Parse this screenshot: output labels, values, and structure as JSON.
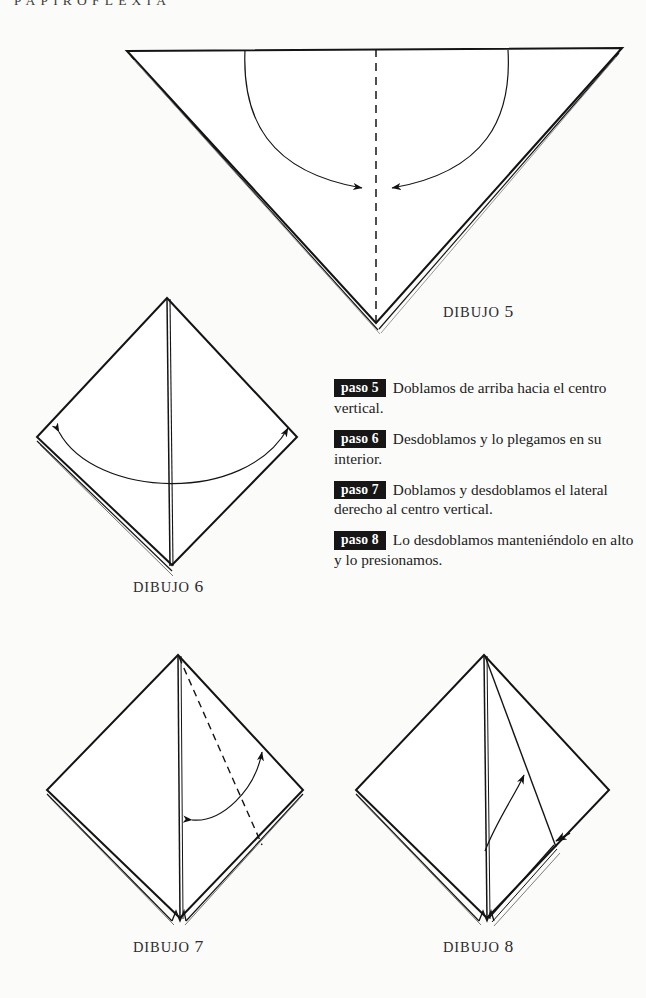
{
  "page": {
    "running_head": "PAPIROFLEXIA",
    "background_color": "#fbfbfa",
    "ink_color": "#1a1a1a"
  },
  "steps": [
    {
      "badge": "paso 5",
      "text": "Doblamos de arriba hacia el centro vertical."
    },
    {
      "badge": "paso 6",
      "text": "Desdoblamos y lo plegamos en su interior."
    },
    {
      "badge": "paso 7",
      "text": "Doblamos y desdoblamos el lateral derecho al centro vertical."
    },
    {
      "badge": "paso 8",
      "text": "Lo desdoblamos manteniéndolo en alto y lo presionamos."
    }
  ],
  "figures": [
    {
      "caption_word": "DIBUJO",
      "caption_number": "5",
      "shape": "inverted-triangle",
      "fold_line": "dashed-vertical-center",
      "arrows": "two-converging-arcs"
    },
    {
      "caption_word": "DIBUJO",
      "caption_number": "6",
      "shape": "diamond-kite",
      "fold_line": "solid-vertical-center",
      "arrows": "wide-arc-both-ends"
    },
    {
      "caption_word": "DIBUJO",
      "caption_number": "7",
      "shape": "diamond-kite",
      "fold_line": "dashed-diagonal-right",
      "arrows": "double-headed-arc"
    },
    {
      "caption_word": "DIBUJO",
      "caption_number": "8",
      "shape": "diamond-kite",
      "fold_line": "solid-diagonal-right",
      "arrows": "upward-arc-and-press-arrow"
    }
  ]
}
